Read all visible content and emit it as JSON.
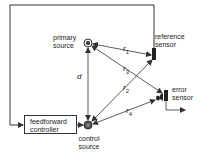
{
  "diagram": {
    "type": "feedforward active noise control block diagram",
    "nodes": {
      "primary_source": {
        "label_line1": "primary",
        "label_line2": "source"
      },
      "reference_sensor": {
        "label_line1": "reference",
        "label_line2": "sensor"
      },
      "error_sensor": {
        "label_line1": "error",
        "label_line2": "sensor"
      },
      "controller": {
        "label_line1": "feedforward",
        "label_line2": "controller"
      },
      "control_source": {
        "label_line1": "control",
        "label_line2": "source"
      }
    },
    "distances": {
      "d": "d",
      "r1": {
        "base": "r",
        "sub": "1"
      },
      "r2": {
        "base": "r",
        "sub": "2"
      },
      "r3": {
        "base": "r",
        "sub": "3"
      },
      "r4": {
        "base": "r",
        "sub": "4"
      }
    },
    "edges": [
      {
        "from": "primary_source",
        "to": "reference_sensor",
        "label": "r1"
      },
      {
        "from": "primary_source",
        "to": "error_sensor",
        "label": "r3"
      },
      {
        "from": "control_source",
        "to": "reference_sensor",
        "label": "r2"
      },
      {
        "from": "control_source",
        "to": "error_sensor",
        "label": "r4"
      },
      {
        "from": "primary_source",
        "to": "control_source",
        "label": "d"
      },
      {
        "from": "reference_sensor",
        "to": "controller",
        "label": ""
      },
      {
        "from": "controller",
        "to": "control_source",
        "label": ""
      }
    ],
    "colors": {
      "line": "#333333",
      "background": "#ffffff"
    }
  }
}
